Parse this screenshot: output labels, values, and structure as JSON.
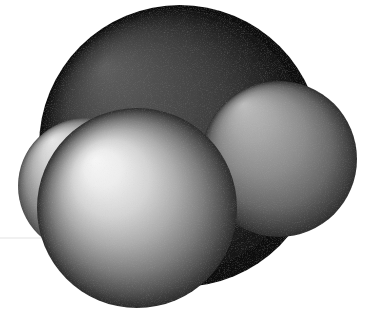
{
  "image": {
    "kind": "space-filling-molecular-model",
    "title": "Space-filling (CPK) molecular model",
    "background_color": "#ffffff",
    "width": 377,
    "height": 317,
    "render_style": "matte shaded spheres, light source upper-left",
    "scan_artifact_line_y": 238,
    "scan_artifact_color": "#ededed",
    "grain": "fine monochrome scan noise"
  },
  "atoms": [
    {
      "name": "central-dark-atom",
      "label": "dark sphere",
      "role": "central",
      "depth": "back",
      "cx": 180,
      "cy": 146,
      "r": 141,
      "highlight_cx": 104,
      "highlight_cy": 66,
      "highlight_color": "#5e5e5e",
      "mid_color": "#3c3c3c",
      "edge_color": "#111111",
      "rim_color": "#0a0a0a"
    },
    {
      "name": "right-gray-atom",
      "label": "right sphere",
      "role": "substituent",
      "depth": "back",
      "cx": 279,
      "cy": 159,
      "r": 78,
      "highlight_cx": 243,
      "highlight_cy": 104,
      "highlight_color": "#b8b8b8",
      "mid_color": "#8c8c8c",
      "edge_color": "#4a4a4a",
      "rim_color": "#2e2e2e"
    },
    {
      "name": "left-gray-atom",
      "label": "left sphere",
      "role": "substituent",
      "depth": "back",
      "cx": 86,
      "cy": 186,
      "r": 68,
      "highlight_cx": 52,
      "highlight_cy": 140,
      "highlight_color": "#e2e2e2",
      "mid_color": "#b4b4b4",
      "edge_color": "#6e6e6e",
      "rim_color": "#4c4c4c"
    },
    {
      "name": "front-light-atom",
      "label": "front sphere",
      "role": "substituent",
      "depth": "front",
      "cx": 137,
      "cy": 208,
      "r": 100,
      "highlight_cx": 95,
      "highlight_cy": 160,
      "highlight_color": "#f4f4f4",
      "mid_color": "#b0b0b0",
      "edge_color": "#4f4f4f",
      "rim_color": "#2b2b2b"
    }
  ],
  "draw_order": [
    "central-dark-atom",
    "left-gray-atom",
    "right-gray-atom",
    "front-light-atom"
  ]
}
